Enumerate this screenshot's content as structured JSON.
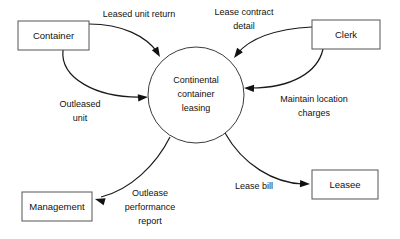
{
  "diagram": {
    "type": "data-flow-diagram",
    "background_color": "#ffffff",
    "line_color": "#1a1a1a",
    "box_stroke_color": "#555555",
    "process": {
      "name": "continental-container-leasing-process",
      "label_lines": [
        "Continental",
        "container",
        "leasing"
      ],
      "line1": "Continental",
      "line2": "container",
      "line3": "leasing",
      "cx": 196,
      "cy": 95,
      "r": 48
    },
    "entities": [
      {
        "name": "container-entity",
        "label": "Container",
        "x": 18,
        "y": 21,
        "w": 71,
        "h": 29,
        "cx": 53.5,
        "cy": 35.5
      },
      {
        "name": "clerk-entity",
        "label": "Clerk",
        "x": 312,
        "y": 20,
        "w": 68,
        "h": 29,
        "cx": 346,
        "cy": 34.5
      },
      {
        "name": "management-entity",
        "label": "Management",
        "x": 22,
        "y": 192,
        "w": 70,
        "h": 29,
        "cx": 57,
        "cy": 206.5
      },
      {
        "name": "leasee-entity",
        "label": "Leasee",
        "x": 312,
        "y": 170,
        "w": 66,
        "h": 29,
        "cx": 345,
        "cy": 184.5
      }
    ],
    "flows": [
      {
        "name": "flow-leased-unit-return",
        "label_lines": [
          "Leased unit return"
        ],
        "line1": "Leased unit return",
        "from": "container-entity",
        "to": "continental-container-leasing-process",
        "label_x": 139,
        "label_y": 17,
        "path": "M 89 24 C 122 24 146 36 158 53",
        "arrow_x": 160,
        "arrow_y": 57,
        "arrow_angle": 60
      },
      {
        "name": "flow-outleased-unit",
        "label_lines": [
          "Outleased",
          "unit"
        ],
        "line1": "Outleased",
        "line2": "unit",
        "from": "container-entity",
        "to": "continental-container-leasing-process",
        "label_x": 80,
        "label_y": 107,
        "path": "M 63 50 C 60 78 96 98 142 97",
        "arrow_x": 148,
        "arrow_y": 97,
        "arrow_angle": 355
      },
      {
        "name": "flow-lease-contract-detail",
        "label_lines": [
          "Lease contract",
          "detail"
        ],
        "line1": "Lease contract",
        "line2": "detail",
        "from": "clerk-entity",
        "to": "continental-container-leasing-process",
        "label_x": 244,
        "label_y": 15,
        "path": "M 312 27 C 276 29 250 38 237 54",
        "arrow_x": 234,
        "arrow_y": 58,
        "arrow_angle": 127
      },
      {
        "name": "flow-maintain-location-charges",
        "label_lines": [
          "Maintain location",
          "charges"
        ],
        "line1": "Maintain location",
        "line2": "charges",
        "from": "clerk-entity",
        "to": "continental-container-leasing-process",
        "label_x": 314,
        "label_y": 102,
        "path": "M 323 49 C 318 72 292 88 251 88",
        "arrow_x": 244,
        "arrow_y": 88,
        "arrow_angle": 182
      },
      {
        "name": "flow-outlease-performance-report",
        "label_lines": [
          "Outlease",
          "performance",
          "report"
        ],
        "line1": "Outlease",
        "line2": "performance",
        "line3": "report",
        "from": "continental-container-leasing-process",
        "to": "management-entity",
        "label_x": 150,
        "label_y": 196,
        "path": "M 170 137 C 156 165 130 190 101 197",
        "arrow_x": 95,
        "arrow_y": 199,
        "arrow_angle": 196
      },
      {
        "name": "flow-lease-bill",
        "label_lines": [
          "Lease bill"
        ],
        "line1": "Lease bill",
        "from": "continental-container-leasing-process",
        "to": "leasee-entity",
        "label_x": 254,
        "label_y": 189,
        "path": "M 225 133 C 243 165 274 183 303 184",
        "arrow_x": 310,
        "arrow_y": 184,
        "arrow_angle": 2
      }
    ]
  }
}
